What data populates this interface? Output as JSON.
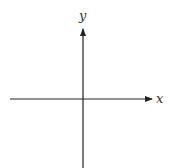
{
  "diagram": {
    "type": "cartesian-axes",
    "x_axis": {
      "label": "x",
      "direction": "right-arrow"
    },
    "y_axis": {
      "label": "y",
      "direction": "up-arrow"
    },
    "colors": {
      "axis": "#222222",
      "background": "#ffffff"
    }
  }
}
